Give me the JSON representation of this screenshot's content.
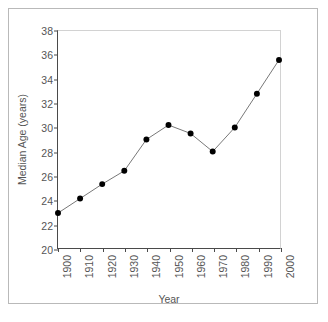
{
  "chart_data": {
    "type": "line",
    "title": "",
    "xlabel": "Year",
    "ylabel": "Median Age (years)",
    "categories": [
      "1900",
      "1910",
      "1920",
      "1930",
      "1940",
      "1950",
      "1960",
      "1970",
      "1980",
      "1990",
      "2000"
    ],
    "values": [
      22.9,
      24.1,
      25.3,
      26.4,
      29.0,
      30.2,
      29.5,
      28.0,
      30.0,
      32.8,
      35.6
    ],
    "series": [
      {
        "name": "Median Age",
        "values": [
          22.9,
          24.1,
          25.3,
          26.4,
          29.0,
          30.2,
          29.5,
          28.0,
          30.0,
          32.8,
          35.6
        ]
      }
    ],
    "ylim": [
      20,
      38
    ],
    "yticks": [
      20,
      22,
      24,
      26,
      28,
      30,
      32,
      34,
      36,
      38
    ],
    "ytick_labels": [
      "20",
      "22",
      "24",
      "26",
      "28",
      "30",
      "32",
      "34",
      "36",
      "38"
    ],
    "xtick_labels": [
      "1900",
      "1910",
      "1920",
      "1930",
      "1940",
      "1950",
      "1960",
      "1970",
      "1980",
      "1990",
      "2000"
    ],
    "xtick_rotation": 90,
    "grid": false,
    "legend": false,
    "legend_position": "none",
    "marker": "filled-circle",
    "marker_color": "#000000",
    "line_color": "#777777",
    "axis_color": "#4a4a4a",
    "plot_border_color": "#d2d2d2",
    "frame_color": "#b9b9b9",
    "text_color": "#555555",
    "background": "#ffffff"
  }
}
